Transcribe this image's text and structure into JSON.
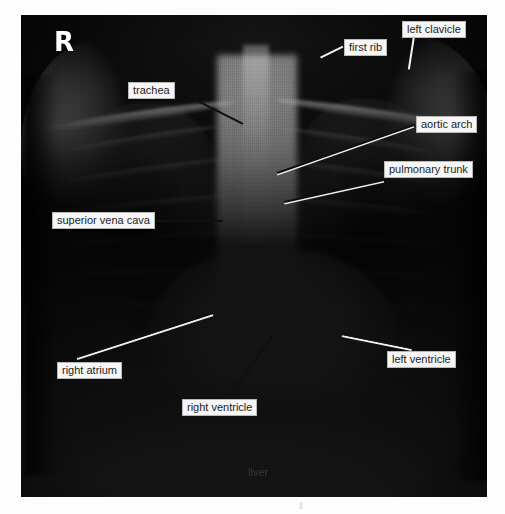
{
  "figure": {
    "type": "annotated-radiograph",
    "modality": "chest-x-ray",
    "view": "PA (postero-anterior)",
    "side_marker": "R"
  },
  "annotations": [
    {
      "id": "trachea",
      "label": "trachea",
      "boxed": true,
      "box": {
        "x": 128,
        "y": 82,
        "w": 46,
        "h": 15
      },
      "leader": {
        "x1": 176,
        "y1": 89,
        "x2": 243,
        "y2": 123
      },
      "style": "black"
    },
    {
      "id": "first-rib",
      "label": "first rib",
      "boxed": true,
      "box": {
        "x": 344,
        "y": 39,
        "w": 47,
        "h": 15
      },
      "leader": {
        "x1": 343,
        "y1": 46,
        "x2": 321,
        "y2": 57
      },
      "style": "white"
    },
    {
      "id": "left-clavicle",
      "label": "left clavicle",
      "boxed": true,
      "box": {
        "x": 402,
        "y": 21,
        "w": 63,
        "h": 15
      },
      "leader": {
        "x1": 414,
        "y1": 37,
        "x2": 409,
        "y2": 69
      },
      "style": "white"
    },
    {
      "id": "aortic-arch",
      "label": "aortic arch",
      "boxed": true,
      "box": {
        "x": 416,
        "y": 116,
        "w": 63,
        "h": 15
      },
      "leader": {
        "x1": 414,
        "y1": 124,
        "x2": 277,
        "y2": 172
      },
      "style": "pair"
    },
    {
      "id": "pulmonary-trunk",
      "label": "pulmonary trunk",
      "boxed": true,
      "box": {
        "x": 384,
        "y": 161,
        "w": 93,
        "h": 15
      },
      "leader": {
        "x1": 384,
        "y1": 179,
        "x2": 284,
        "y2": 201
      },
      "style": "pair"
    },
    {
      "id": "superior-vena-cava",
      "label": "superior vena cava",
      "boxed": true,
      "box": {
        "x": 52,
        "y": 212,
        "w": 97,
        "h": 15
      },
      "leader": {
        "x1": 151,
        "y1": 220,
        "x2": 223,
        "y2": 220
      },
      "style": "black"
    },
    {
      "id": "right-atrium",
      "label": "right atrium",
      "boxed": true,
      "box": {
        "x": 57,
        "y": 362,
        "w": 70,
        "h": 15
      },
      "leader": {
        "x1": 77,
        "y1": 356,
        "x2": 213,
        "y2": 312
      },
      "style": "pair"
    },
    {
      "id": "left-ventricle",
      "label": "left ventricle",
      "boxed": true,
      "box": {
        "x": 387,
        "y": 351,
        "w": 66,
        "h": 15
      },
      "leader": {
        "x1": 342,
        "y1": 333,
        "x2": 412,
        "y2": 347
      },
      "style": "pair"
    },
    {
      "id": "right-ventricle",
      "label": "right ventricle",
      "boxed": true,
      "box": {
        "x": 182,
        "y": 399,
        "w": 79,
        "h": 15
      },
      "leader": {
        "x1": 231,
        "y1": 394,
        "x2": 272,
        "y2": 335
      },
      "style": "black"
    },
    {
      "id": "liver",
      "label": "liver",
      "boxed": false,
      "box": {
        "x": 248,
        "y": 466,
        "w": 30,
        "h": 14
      },
      "leader": null,
      "style": "none"
    }
  ],
  "colors": {
    "label_background": "#f6f6f6",
    "label_border": "#b9b9b9",
    "label_text": "#1d1d1d",
    "leader_black": "#101010",
    "leader_white": "#f4f4f4",
    "page_background": "#fdfdfd",
    "marker_text": "#ffffff"
  }
}
